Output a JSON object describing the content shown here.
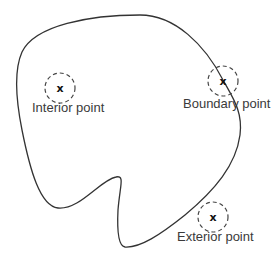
{
  "diagram": {
    "region": {
      "stroke_color": "#333333"
    },
    "points": [
      {
        "id": "interior",
        "label": "Interior point",
        "marker": "x"
      },
      {
        "id": "boundary",
        "label": "Boundary point",
        "marker": "x"
      },
      {
        "id": "exterior",
        "label": "Exterior point",
        "marker": "x"
      }
    ],
    "neighborhood_style": "dashed-circle",
    "colors": {
      "curve": "#333333",
      "circle": "#444444",
      "text": "#3a3a3a",
      "marker": "#111111",
      "background": "#ffffff"
    }
  }
}
